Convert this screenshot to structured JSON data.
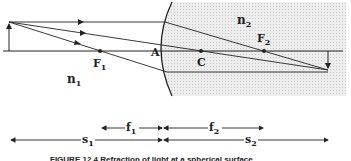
{
  "figure": {
    "caption": "FIGURE 12.4  Refraction of light at a spherical surface",
    "labels": {
      "n1": "n",
      "n1_sub": "1",
      "n2": "n",
      "n2_sub": "2",
      "F1": "F",
      "F1_sub": "1",
      "F2": "F",
      "F2_sub": "2",
      "A": "A",
      "C": "C"
    },
    "distances": {
      "f1": "f",
      "f1_sub": "1",
      "f2": "f",
      "f2_sub": "2",
      "s1": "s",
      "s1_sub": "1",
      "s2": "s",
      "s2_sub": "2"
    },
    "colors": {
      "line": "#222222",
      "medium2_fill": "#e6e6e6"
    }
  }
}
